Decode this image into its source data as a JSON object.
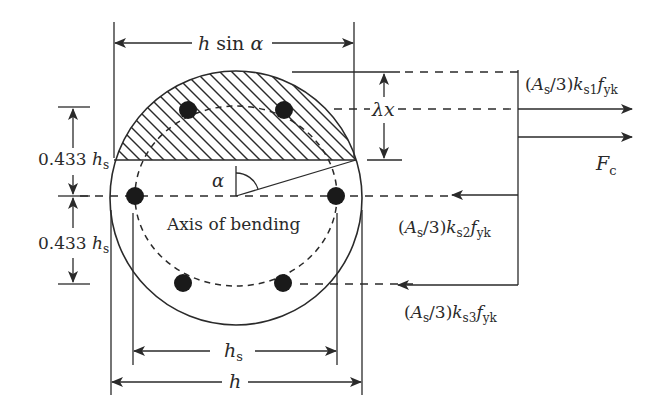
{
  "diagram": {
    "colors": {
      "ink": "#2a2a2a",
      "background": "#ffffff"
    },
    "labels": {
      "top_width": {
        "var": "h",
        "fn": " sin ",
        "greek": "α"
      },
      "lambda_x": {
        "greek": "λ",
        "var": "x"
      },
      "upper_offset": {
        "num": "0.433 ",
        "var": "h",
        "sub": "s"
      },
      "lower_offset": {
        "num": "0.433 ",
        "var": "h",
        "sub": "s"
      },
      "alpha": "α",
      "axis": "Axis of bending",
      "hs": {
        "var": "h",
        "sub": "s"
      },
      "h": "h",
      "fc": {
        "var": "F",
        "sub": "c"
      },
      "force1": {
        "open": "(",
        "A": "A",
        "As_sub": "s",
        "mid": "/3)",
        "k": "k",
        "k_sub": "s1",
        "f": "f",
        "f_sub": "yk"
      },
      "force2": {
        "open": "(",
        "A": "A",
        "As_sub": "s",
        "mid": "/3)",
        "k": "k",
        "k_sub": "s2",
        "f": "f",
        "f_sub": "yk"
      },
      "force3": {
        "open": "(",
        "A": "A",
        "As_sub": "s",
        "mid": "/3)",
        "k": "k",
        "k_sub": "s3",
        "f": "f",
        "f_sub": "yk"
      }
    },
    "bars": [
      {
        "id": "bar-top-left",
        "x": 188,
        "y": 110
      },
      {
        "id": "bar-top-right",
        "x": 284,
        "y": 110
      },
      {
        "id": "bar-mid-left",
        "x": 135,
        "y": 196
      },
      {
        "id": "bar-mid-right",
        "x": 336,
        "y": 196
      },
      {
        "id": "bar-bottom-left",
        "x": 183,
        "y": 283
      },
      {
        "id": "bar-bottom-right",
        "x": 283,
        "y": 283
      }
    ]
  }
}
